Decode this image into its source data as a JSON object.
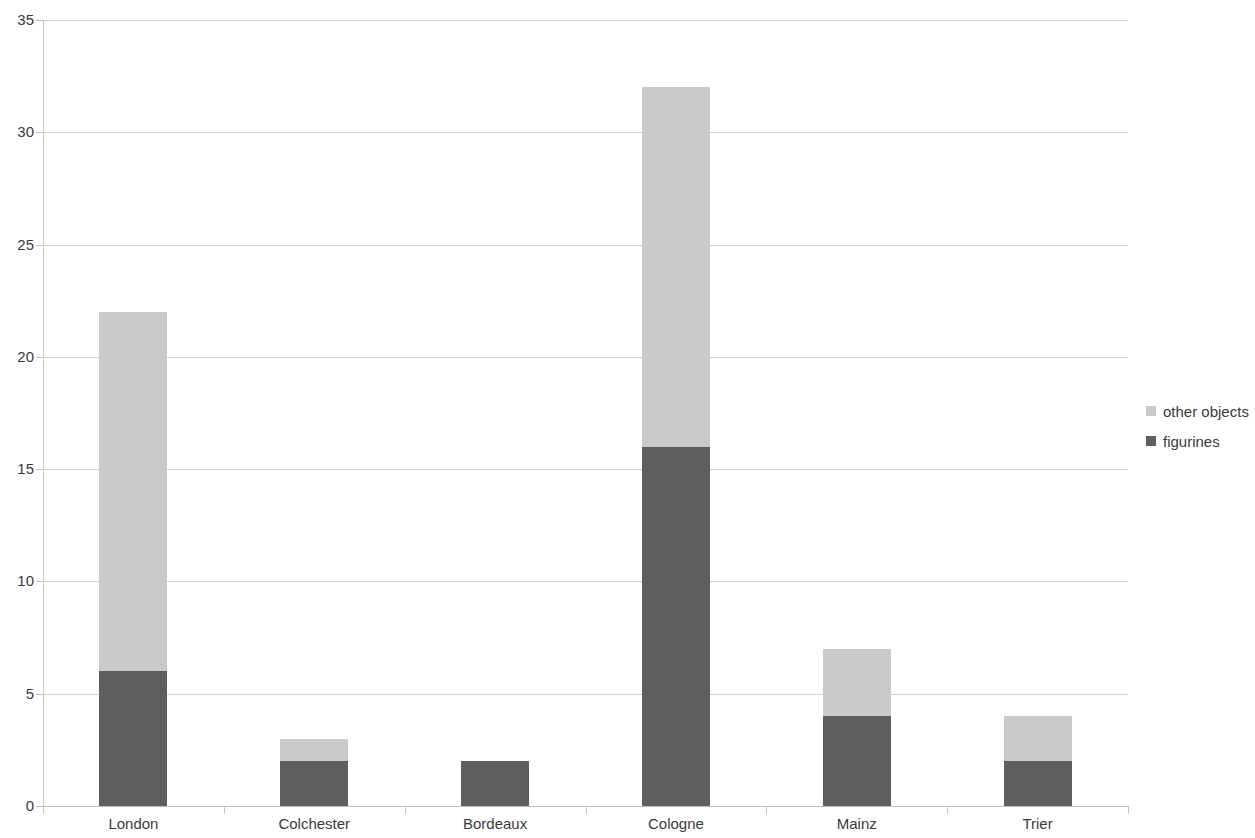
{
  "chart_data": {
    "type": "bar",
    "stacked": true,
    "title": "",
    "subtitle": "",
    "xlabel": "",
    "ylabel": "",
    "categories": [
      "London",
      "Colchester",
      "Bordeaux",
      "Cologne",
      "Mainz",
      "Trier"
    ],
    "series": [
      {
        "name": "figurines",
        "values": [
          6,
          2,
          2,
          16,
          4,
          2
        ],
        "color": "#5e5e5e"
      },
      {
        "name": "other objects",
        "values": [
          16,
          1,
          0,
          16,
          3,
          2
        ],
        "color": "#c9c9c9"
      }
    ],
    "stack_order_bottom_to_top": [
      "figurines",
      "other objects"
    ],
    "totals": [
      22,
      3,
      2,
      32,
      7,
      4
    ],
    "ylim": [
      0,
      35
    ],
    "y_ticks": [
      0,
      5,
      10,
      15,
      20,
      25,
      30,
      35
    ],
    "y_tick_labels": [
      "0",
      "5",
      "10",
      "15",
      "20",
      "25",
      "30",
      "35"
    ],
    "grid": true,
    "grid_axis": "y",
    "legend_position": "right",
    "legend_entries": [
      "other objects",
      "figurines"
    ],
    "colors": {
      "other_objects": "#c9c9c9",
      "figurines": "#5e5e5e",
      "gridline": "#d0d0d0",
      "axis": "#bdbdbd",
      "text": "#3a3a3a",
      "background": "#ffffff"
    }
  },
  "legend": {
    "items": [
      {
        "label": "other objects",
        "swatch_color": "#c9c9c9"
      },
      {
        "label": "figurines",
        "swatch_color": "#5e5e5e"
      }
    ]
  }
}
